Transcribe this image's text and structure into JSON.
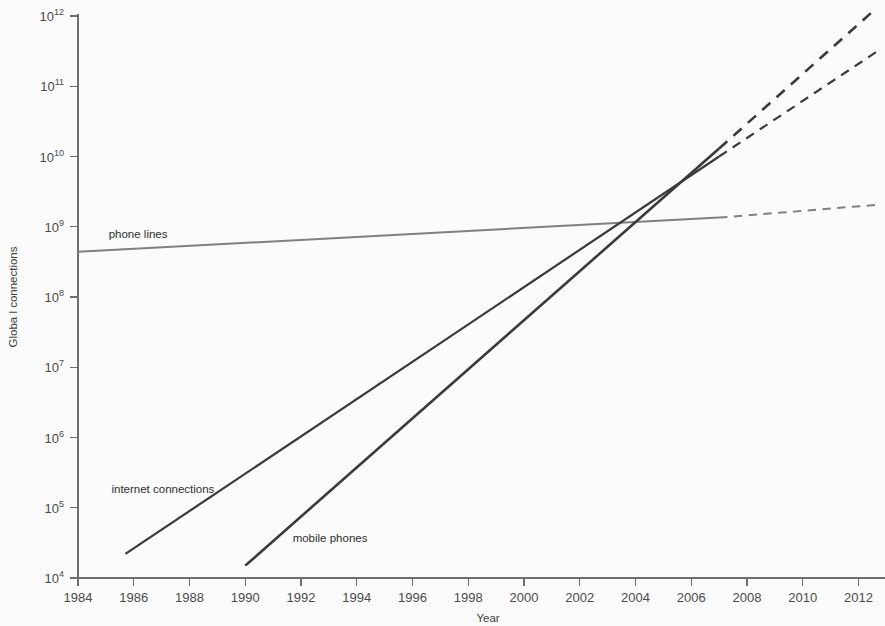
{
  "chart_data": {
    "type": "line",
    "title": "",
    "xlabel": "Year",
    "ylabel": "Globa l connections",
    "xlim": [
      1984,
      2012.7
    ],
    "ylim": [
      10000,
      1000000000000
    ],
    "yscale": "log",
    "grid": false,
    "legend_position": "inline-labels",
    "xticks": [
      1984,
      1986,
      1988,
      1990,
      1992,
      1994,
      1996,
      1998,
      2000,
      2002,
      2004,
      2006,
      2008,
      2010,
      2012
    ],
    "xtick_labels": [
      "1984",
      "1986",
      "1988",
      "1990",
      "1992",
      "1994",
      "1996",
      "1998",
      "2000",
      "2002",
      "2004",
      "2006",
      "2008",
      "2010",
      "2012"
    ],
    "yticks": [
      10000,
      100000,
      1000000,
      10000000,
      100000000,
      1000000000,
      10000000000,
      100000000000,
      1000000000000
    ],
    "ytick_labels": [
      "10⁴",
      "10⁵",
      "10⁶",
      "10⁷",
      "10⁸",
      "10⁹",
      "10¹⁰",
      "10¹¹",
      "10¹²"
    ],
    "ytick_bases": [
      "10",
      "10",
      "10",
      "10",
      "10",
      "10",
      "10",
      "10",
      "10"
    ],
    "ytick_exponents": [
      "4",
      "5",
      "6",
      "7",
      "8",
      "9",
      "10",
      "11",
      "12"
    ],
    "series": [
      {
        "name": "phone lines",
        "label": "phone lines",
        "color": "#808080",
        "width": 2.0,
        "solid": [
          [
            1984.0,
            440000000
          ],
          [
            2007.0,
            1350000000
          ]
        ],
        "dashed": [
          [
            2007.0,
            1350000000
          ],
          [
            2012.65,
            2050000000
          ]
        ],
        "label_x": 1985.1,
        "label_y": 700000000
      },
      {
        "name": "internet connections",
        "label": "internet connections",
        "color": "#3a3a3a",
        "width": 2.2,
        "solid": [
          [
            1985.7,
            22000
          ],
          [
            2007.0,
            10000000000
          ]
        ],
        "dashed": [
          [
            2007.0,
            10000000000
          ],
          [
            2012.65,
            310000000000
          ]
        ],
        "label_x": 1985.2,
        "label_y": 160000
      },
      {
        "name": "mobile phones",
        "label": "mobile phones",
        "color": "#3a3a3a",
        "width": 2.6,
        "solid": [
          [
            1990.0,
            15000
          ],
          [
            2007.0,
            13000000000
          ]
        ],
        "dashed": [
          [
            2007.0,
            13000000000
          ],
          [
            2012.65,
            1300000000000
          ]
        ],
        "label_x": 1991.7,
        "label_y": 33000
      }
    ],
    "crossings": [
      {
        "series_a": "mobile phones",
        "series_b": "phone lines",
        "year": 2003.2,
        "value": 1200000000
      },
      {
        "series_a": "internet connections",
        "series_b": "phone lines",
        "year": 2003.8,
        "value": 1250000000
      },
      {
        "series_a": "mobile phones",
        "series_b": "internet connections",
        "year": 2005.6,
        "value": 5200000000
      }
    ]
  },
  "axes": {
    "x_title": "Year",
    "y_title": "Globa l connections"
  }
}
